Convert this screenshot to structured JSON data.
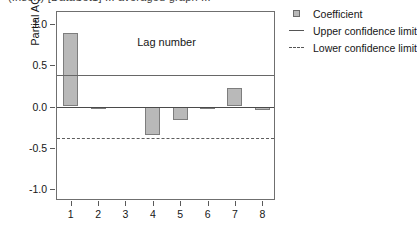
{
  "clipped_title": "(Insert) [DataSet1] ... averaged graph ...",
  "chart_data": {
    "type": "bar",
    "title": "",
    "xlabel": "Lag number",
    "ylabel": "Partial ACF",
    "categories": [
      "1",
      "2",
      "3",
      "4",
      "5",
      "6",
      "7",
      "8"
    ],
    "values": [
      0.9,
      -0.03,
      0.0,
      -0.35,
      -0.17,
      -0.02,
      0.22,
      -0.04
    ],
    "series": [
      {
        "name": "Coefficient",
        "values": [
          0.9,
          -0.03,
          0.0,
          -0.35,
          -0.17,
          -0.02,
          0.22,
          -0.04
        ]
      }
    ],
    "ylim": [
      -1.15,
      1.15
    ],
    "yticks": [
      1.0,
      0.5,
      0.0,
      -0.5,
      -1.0
    ],
    "ytick_labels": [
      "1.0",
      "0.5",
      "0.0",
      "-0.5",
      "-1.0"
    ],
    "xticks": [
      1,
      2,
      3,
      4,
      5,
      6,
      7,
      8
    ],
    "xtick_labels": [
      "1",
      "2",
      "3",
      "4",
      "5",
      "6",
      "7",
      "8"
    ],
    "upper_confidence_limit": 0.38,
    "lower_confidence_limit": -0.38,
    "zero_line": 0.0,
    "grid": false,
    "legend_position": "top-right",
    "bar_color": "#b9b9b9",
    "bar_border_color": "#7d7d7d",
    "upper_limit_color": "#676767",
    "lower_limit_color": "#5d5d5d"
  },
  "legend": {
    "items": [
      {
        "label": "Coefficient",
        "key": "square-swatch"
      },
      {
        "label": "Upper confidence limit",
        "key": "solid-line"
      },
      {
        "label": "Lower confidence limit",
        "key": "dashed-line"
      }
    ]
  }
}
